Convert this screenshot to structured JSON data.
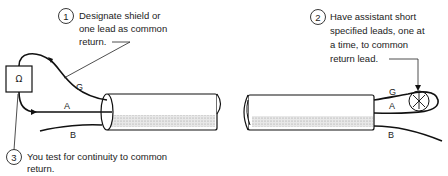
{
  "diagram": {
    "meter_symbol": "Ω",
    "wire_labels": {
      "left": {
        "g": "G",
        "a": "A",
        "b": "B"
      },
      "right": {
        "g": "G",
        "a": "A",
        "b": "B"
      }
    },
    "callouts": [
      {
        "number": "1",
        "lines": [
          "Designate shield or",
          "one lead as common",
          "return."
        ]
      },
      {
        "number": "2",
        "lines": [
          "Have assistant short",
          "specified leads, one at",
          "a time, to common",
          "return lead."
        ]
      },
      {
        "number": "3",
        "lines": [
          "You test for continuity to common",
          "return."
        ]
      }
    ],
    "colors": {
      "ink": "#111111",
      "shading": "#bdbdbd",
      "background": "#ffffff"
    }
  }
}
